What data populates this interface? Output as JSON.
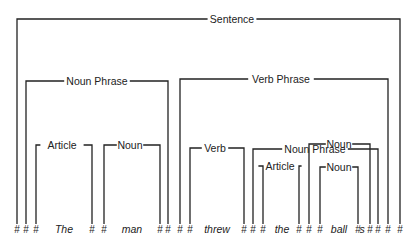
{
  "diagram": {
    "colors": {
      "ink": "#222222",
      "background": "#ffffff"
    },
    "nodes": [
      {
        "id": "sentence",
        "label": "Sentence",
        "y": 19,
        "x1": 17,
        "x2": 400,
        "labelX": 232
      },
      {
        "id": "np1",
        "label": "Noun Phrase",
        "y": 81,
        "x1": 26,
        "x2": 168,
        "labelX": 97
      },
      {
        "id": "vp",
        "label": "Verb Phrase",
        "y": 79,
        "x1": 180,
        "x2": 388,
        "labelX": 281
      },
      {
        "id": "article1",
        "label": "Article",
        "y": 145,
        "x1": 36,
        "x2": 92,
        "labelX": 62
      },
      {
        "id": "noun1",
        "label": "Noun",
        "y": 145,
        "x1": 104,
        "x2": 160,
        "labelX": 130
      },
      {
        "id": "verb",
        "label": "Verb",
        "y": 148,
        "x1": 190,
        "x2": 244,
        "labelX": 215
      },
      {
        "id": "np2",
        "label": "Noun Phrase",
        "y": 149,
        "x1": 253,
        "x2": 378,
        "labelX": 315
      },
      {
        "id": "noun2-outer",
        "label": "Noun",
        "y": 144,
        "x1": 309,
        "x2": 370,
        "labelX": 339
      },
      {
        "id": "article2",
        "label": "Article",
        "y": 166,
        "x1": 263,
        "x2": 299,
        "labelX": 280
      },
      {
        "id": "noun2-inner",
        "label": "Noun",
        "y": 167,
        "x1": 320,
        "x2": 358,
        "labelX": 339
      }
    ],
    "baseline_y": 230,
    "hashes": [
      {
        "x": 17
      },
      {
        "x": 26
      },
      {
        "x": 36
      },
      {
        "x": 92
      },
      {
        "x": 104
      },
      {
        "x": 160
      },
      {
        "x": 168
      },
      {
        "x": 180
      },
      {
        "x": 190
      },
      {
        "x": 244
      },
      {
        "x": 253
      },
      {
        "x": 263
      },
      {
        "x": 299
      },
      {
        "x": 309
      },
      {
        "x": 320
      },
      {
        "x": 358
      },
      {
        "x": 370
      },
      {
        "x": 378
      },
      {
        "x": 388
      },
      {
        "x": 400
      }
    ],
    "words": [
      {
        "text": "The",
        "x": 64
      },
      {
        "text": "man",
        "x": 132
      },
      {
        "text": "threw",
        "x": 217
      },
      {
        "text": "the",
        "x": 282
      },
      {
        "text": "ball",
        "x": 339
      }
    ],
    "suffix": {
      "text": "s",
      "x": 362
    }
  }
}
